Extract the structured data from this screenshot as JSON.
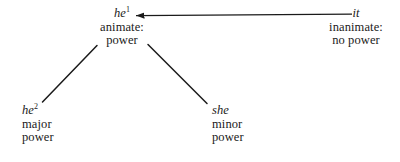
{
  "diagram": {
    "type": "tree",
    "title": "",
    "background_color": "#ffffff",
    "text_color": "#1a1a1a",
    "nodes": [
      {
        "id": "he1",
        "head": "he",
        "superscript": "1",
        "lines": [
          "animate:",
          "power"
        ],
        "align": "center"
      },
      {
        "id": "it",
        "head": "it",
        "superscript": "",
        "lines": [
          "inanimate:",
          "no power"
        ],
        "align": "center"
      },
      {
        "id": "he2",
        "head": "he",
        "superscript": "2",
        "lines": [
          "major",
          "power"
        ],
        "align": "left"
      },
      {
        "id": "she",
        "head": "she",
        "superscript": "",
        "lines": [
          "minor",
          "power"
        ],
        "align": "left"
      }
    ],
    "edges": [
      {
        "id": "arrow-it-to-he1",
        "from": "it",
        "to": "he1",
        "style": "arrow",
        "arrowhead": "left"
      },
      {
        "id": "branch-he1-to-he2",
        "from": "he1",
        "to": "he2",
        "style": "line",
        "arrowhead": "none"
      },
      {
        "id": "branch-he1-to-she",
        "from": "he1",
        "to": "she",
        "style": "line",
        "arrowhead": "none"
      }
    ]
  }
}
